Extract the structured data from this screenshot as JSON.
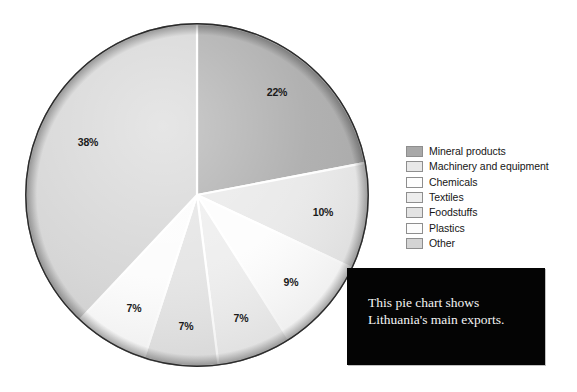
{
  "caption": {
    "line1": "This pie chart shows",
    "line2": "Lithuania's main exports."
  },
  "legend": {
    "items": [
      {
        "label": "Mineral products",
        "color": "#a8a8a8"
      },
      {
        "label": "Machinery and equipment",
        "color": "#e8e8e8"
      },
      {
        "label": "Chemicals",
        "color": "#fdfdfd"
      },
      {
        "label": "Textiles",
        "color": "#ededed"
      },
      {
        "label": "Foodstuffs",
        "color": "#e3e3e3"
      },
      {
        "label": "Plastics",
        "color": "#fcfcfc"
      },
      {
        "label": "Other",
        "color": "#d4d4d4"
      }
    ]
  },
  "chart_data": {
    "type": "pie",
    "title": "",
    "xlabel": "",
    "ylabel": "",
    "legend_position": "right",
    "grid": false,
    "start_angle_deg": 0,
    "direction": "clockwise",
    "categories": [
      "Mineral products",
      "Machinery and equipment",
      "Chemicals",
      "Textiles",
      "Foodstuffs",
      "Plastics",
      "Other"
    ],
    "values": [
      22,
      10,
      9,
      7,
      7,
      7,
      38
    ],
    "value_unit": "%",
    "data_labels": [
      "22%",
      "10%",
      "9%",
      "7%",
      "7%",
      "7%",
      "38%"
    ],
    "colors": [
      "#a8a8a8",
      "#e8e8e8",
      "#fdfdfd",
      "#ededed",
      "#e3e3e3",
      "#fcfcfc",
      "#d4d4d4"
    ],
    "label_positions": [
      {
        "label": "22%",
        "x": 277,
        "y": 96
      },
      {
        "label": "10%",
        "x": 323,
        "y": 216
      },
      {
        "label": "9%",
        "x": 291,
        "y": 286
      },
      {
        "label": "7%",
        "x": 241,
        "y": 322
      },
      {
        "label": "7%",
        "x": 186,
        "y": 330
      },
      {
        "label": "7%",
        "x": 134,
        "y": 312
      },
      {
        "label": "38%",
        "x": 88,
        "y": 146
      }
    ]
  }
}
